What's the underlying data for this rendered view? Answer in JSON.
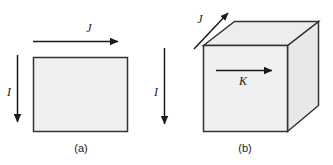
{
  "figure": {
    "caption_a": "(a)",
    "caption_b": "(b)",
    "panels": [
      {
        "id": "a",
        "label": "(a)",
        "shape": "rectangle",
        "arrows": [
          {
            "name": "J",
            "label": "J",
            "direction": "right",
            "meaning": "surface current density"
          },
          {
            "name": "I",
            "label": "I",
            "direction": "down",
            "meaning": "current"
          }
        ]
      },
      {
        "id": "b",
        "label": "(b)",
        "shape": "cube",
        "arrows": [
          {
            "name": "J",
            "label": "J",
            "direction": "up-right-diagonal",
            "meaning": "volume current density"
          },
          {
            "name": "K",
            "label": "K",
            "direction": "right",
            "meaning": "surface current density"
          },
          {
            "name": "I",
            "label": "I",
            "direction": "down",
            "meaning": "current"
          }
        ]
      }
    ],
    "labels": {
      "J_top_a": "J",
      "I_left_a": "I",
      "I_mid_b": "I",
      "J_cube_b": "J",
      "K_cube_b": "K"
    },
    "colors": {
      "face_fill": "#f0f0f0",
      "top_fill": "#ededed",
      "side_fill": "#e8e8e8",
      "outline": "#333333",
      "arrow": "#1a1a1a",
      "background": "#ffffff"
    }
  }
}
